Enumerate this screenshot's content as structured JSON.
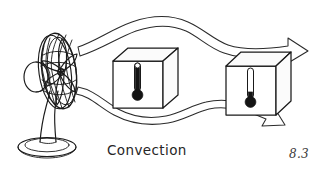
{
  "figure": {
    "title": "Convection",
    "caption_label": "Convection",
    "figure_number": "8.3",
    "background_color": "#ffffff",
    "ink_color": "#1a1a1a",
    "style": "hand-drawn line illustration"
  },
  "fan": {
    "name": "electric pedestal fan",
    "label": "fan",
    "parts": {
      "grille": "circular wire grille",
      "blades": "fan blades",
      "hub": "center hub",
      "neck": "stand neck",
      "base": "oval base"
    }
  },
  "boxes": [
    {
      "label": "near box",
      "thermometer": {
        "name": "thermometer-hot",
        "reading_state": "high",
        "fill_fraction": 0.78
      }
    },
    {
      "label": "far box",
      "thermometer": {
        "name": "thermometer-cool",
        "reading_state": "low",
        "fill_fraction": 0.22
      }
    }
  ],
  "airflow": {
    "label": "airflow",
    "arrows": [
      {
        "name": "upper-airflow-arrow",
        "direction": "left-to-right",
        "shape": "wavy"
      },
      {
        "name": "lower-airflow-arrow",
        "direction": "left-to-right",
        "shape": "wavy"
      }
    ]
  }
}
